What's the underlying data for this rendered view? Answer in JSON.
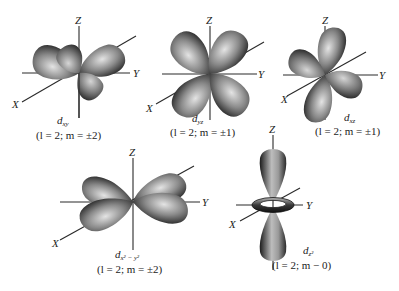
{
  "figure": {
    "orbitals": [
      {
        "id": "dxy",
        "symbol": "d",
        "subscript": "xy",
        "quantum_label": "(l = 2; m = ±2)",
        "axes": {
          "z": "Z",
          "y": "Y",
          "x": "X"
        }
      },
      {
        "id": "dyz",
        "symbol": "d",
        "subscript": "yz",
        "quantum_label": "(l = 2; m = ±1)",
        "axes": {
          "z": "Z",
          "y": "Y",
          "x": "X"
        }
      },
      {
        "id": "dxz",
        "symbol": "d",
        "subscript": "xz",
        "quantum_label": "(l = 2; m = ±1)",
        "axes": {
          "z": "Z",
          "y": "Y",
          "x": "X"
        }
      },
      {
        "id": "dx2-y2",
        "symbol": "d",
        "subscript": "x² − y²",
        "quantum_label": "(l = 2; m = ±2)",
        "axes": {
          "z": "Z",
          "y": "Y",
          "x": "X"
        }
      },
      {
        "id": "dz2",
        "symbol": "d",
        "subscript": "z²",
        "quantum_label": "(l = 2; m − 0)",
        "axes": {
          "z": "Z",
          "y": "Y",
          "x": "X"
        }
      }
    ]
  },
  "colors": {
    "lobe_dark": "#141414",
    "lobe_mid": "#6a6a6a",
    "lobe_light": "#d8d8d8",
    "axis": "#2a2a2a",
    "background": "#ffffff"
  }
}
